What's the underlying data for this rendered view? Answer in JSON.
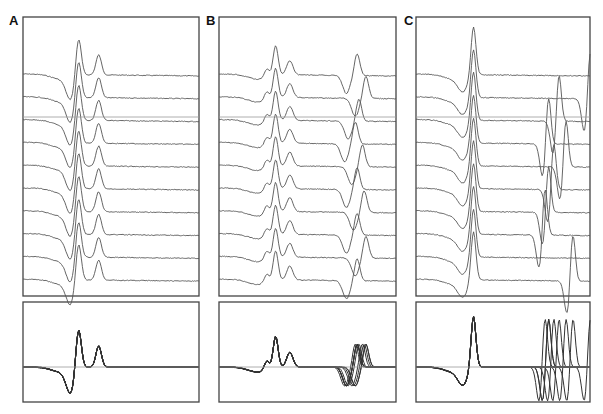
{
  "chart_data": [
    {
      "panel": "A",
      "type": "line",
      "title": "",
      "xlabel": "",
      "ylabel": "",
      "grid": false,
      "description": "10 stacked single-sweep traces, each with a downward deflection followed by a large positive peak and a second smaller peak; fixed latency",
      "traces_count": 10,
      "box": {
        "x": 23,
        "y": 17,
        "w": 176,
        "h": 279
      },
      "ref_line_y": 117,
      "overlay_box": {
        "x": 23,
        "y": 302,
        "w": 176,
        "h": 100
      },
      "components": [
        {
          "pos": 0.27,
          "amp": -0.55,
          "width": 0.035,
          "jitter": 0
        },
        {
          "pos": 0.315,
          "amp": 1.0,
          "width": 0.022,
          "jitter": 0
        },
        {
          "pos": 0.43,
          "amp": 0.5,
          "width": 0.022,
          "jitter": 0
        }
      ]
    },
    {
      "panel": "B",
      "type": "line",
      "description": "10 stacked traces with early fixed-latency complex and a late component with variable latency (jitter)",
      "traces_count": 10,
      "box": {
        "x": 219,
        "y": 17,
        "w": 177,
        "h": 279
      },
      "ref_line_y": 117,
      "overlay_box": {
        "x": 219,
        "y": 302,
        "w": 177,
        "h": 100
      },
      "components": [
        {
          "pos": 0.27,
          "amp": 0.22,
          "width": 0.02,
          "jitter": 0
        },
        {
          "pos": 0.32,
          "amp": 0.75,
          "width": 0.02,
          "jitter": 0
        },
        {
          "pos": 0.4,
          "amp": 0.35,
          "width": 0.025,
          "jitter": 0
        },
        {
          "pos": 0.72,
          "amp": -0.45,
          "width": 0.03,
          "jitter": 0.04
        },
        {
          "pos": 0.78,
          "amp": 0.55,
          "width": 0.022,
          "jitter": 0.04
        }
      ],
      "late_offsets": [
        0.0,
        0.05,
        0.01,
        -0.01,
        0.03,
        0.0,
        0.04,
        0.0,
        0.05,
        0.0
      ]
    },
    {
      "panel": "C",
      "type": "line",
      "description": "10 stacked traces with large early spike and a late biphasic component of highly variable latency",
      "traces_count": 10,
      "box": {
        "x": 416,
        "y": 17,
        "w": 174,
        "h": 279
      },
      "ref_line_y": 117,
      "overlay_box": {
        "x": 416,
        "y": 302,
        "w": 174,
        "h": 100
      },
      "components": [
        {
          "pos": 0.27,
          "amp": -0.35,
          "width": 0.04,
          "jitter": 0
        },
        {
          "pos": 0.33,
          "amp": 1.25,
          "width": 0.02,
          "jitter": 0
        }
      ],
      "late": {
        "base": 0.82,
        "amp_neg": -0.9,
        "amp_pos": 1.3,
        "width": 0.02
      },
      "late_offsets": [
        null,
        0.18,
        0.0,
        -0.06,
        0.04,
        -0.03,
        -0.06,
        -0.08,
        null,
        0.08
      ]
    }
  ],
  "labels": {
    "a": "A",
    "b": "B",
    "c": "C"
  },
  "colors": {
    "trace": "#555555",
    "frame": "#444444",
    "ref": "#999999",
    "overlay": "#333333"
  }
}
